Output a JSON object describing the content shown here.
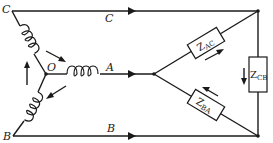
{
  "diagram": {
    "type": "three-phase star-delta circuit",
    "nodes": {
      "C": "C",
      "B": "B",
      "O": "O"
    },
    "lines": {
      "top": "C",
      "middle": "A",
      "bottom": "B"
    },
    "impedances": {
      "ac": {
        "base": "Z",
        "sub": "AC"
      },
      "ba": {
        "base": "Z",
        "sub": "BA"
      },
      "cb": {
        "base": "Z",
        "sub": "CB"
      }
    }
  }
}
